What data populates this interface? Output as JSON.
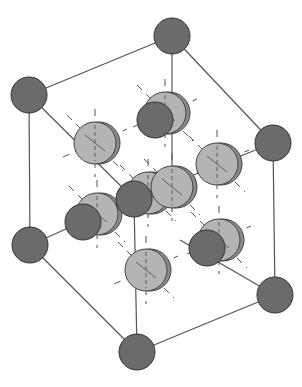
{
  "diagram": {
    "colors": {
      "background": "#ffffff",
      "edge": "#555555",
      "dark_atom": "#6b6b6b",
      "dark_atom_stroke": "#333333",
      "light_atom": "#b4b4b4",
      "light_atom_shadow": "#8a8a8a",
      "light_atom_stroke": "#444444",
      "dash": "#555555"
    },
    "corners": [
      {
        "id": "top-back",
        "cx": 172,
        "cy": 36,
        "r": 18
      },
      {
        "id": "top-left",
        "cx": 29,
        "cy": 95,
        "r": 18
      },
      {
        "id": "top-right",
        "cx": 273,
        "cy": 143,
        "r": 18
      },
      {
        "id": "top-front",
        "cx": 134,
        "cy": 199,
        "r": 18
      },
      {
        "id": "bottom-left",
        "cx": 30,
        "cy": 245,
        "r": 18
      },
      {
        "id": "bottom-back",
        "cx": 165,
        "cy": 226,
        "r": 0
      },
      {
        "id": "bottom-right",
        "cx": 275,
        "cy": 295,
        "r": 18
      },
      {
        "id": "bottom-front",
        "cx": 137,
        "cy": 352,
        "r": 18
      }
    ],
    "edges": [
      [
        172,
        36,
        29,
        95
      ],
      [
        172,
        36,
        273,
        143
      ],
      [
        29,
        95,
        134,
        199
      ],
      [
        273,
        143,
        134,
        199
      ],
      [
        29,
        95,
        30,
        245
      ],
      [
        273,
        143,
        275,
        295
      ],
      [
        134,
        199,
        137,
        352
      ],
      [
        172,
        36,
        172,
        190
      ],
      [
        30,
        245,
        137,
        352
      ],
      [
        275,
        295,
        137,
        352
      ],
      [
        30,
        245,
        120,
        205
      ],
      [
        275,
        295,
        180,
        240
      ]
    ],
    "light_atoms": [
      {
        "cx": 165,
        "cy": 113,
        "r": 21
      },
      {
        "cx": 95,
        "cy": 143,
        "r": 21
      },
      {
        "cx": 217,
        "cy": 164,
        "r": 21
      },
      {
        "cx": 148,
        "cy": 193,
        "r": 21
      },
      {
        "cx": 172,
        "cy": 187,
        "r": 21
      },
      {
        "cx": 97,
        "cy": 214,
        "r": 21
      },
      {
        "cx": 146,
        "cy": 270,
        "r": 21
      },
      {
        "cx": 219,
        "cy": 240,
        "r": 21
      }
    ],
    "dark_front_atoms": [
      {
        "cx": 155,
        "cy": 120,
        "r": 18
      },
      {
        "cx": 83,
        "cy": 222,
        "r": 18
      },
      {
        "cx": 207,
        "cy": 248,
        "r": 18
      }
    ]
  }
}
